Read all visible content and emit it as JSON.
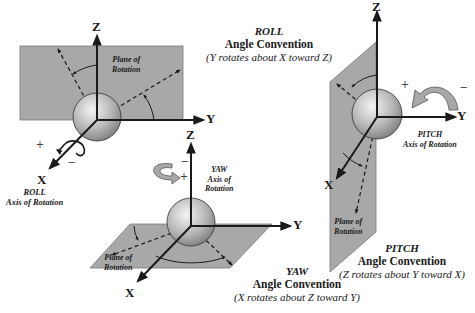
{
  "colors": {
    "plane": "#a8a8a8",
    "plane_edge": "#7a7a7a",
    "axis": "#1a1a1a",
    "ball_light": "#f2f2f2",
    "ball_dark": "#8a8a8a"
  },
  "roll": {
    "title": "ROLL",
    "subtitle": "Angle Convention",
    "description": "(Y rotates about X toward Z)",
    "plane_label_1": "Plane of",
    "plane_label_2": "Rotation",
    "axis_label_1": "ROLL",
    "axis_label_2": "Axis of Rotation",
    "axes": {
      "z": "Z",
      "y": "Y",
      "x": "X"
    },
    "plus": "+",
    "minus": "−"
  },
  "yaw": {
    "title": "YAW",
    "subtitle": "Angle Convention",
    "description": "(X rotates about Z toward Y)",
    "plane_label_1": "Plane of",
    "plane_label_2": "Rotation",
    "axis_label_1": "YAW",
    "axis_label_2": "Axis of",
    "axis_label_3": "Rotation",
    "axes": {
      "z": "Z",
      "y": "Y",
      "x": "X"
    },
    "plus": "+",
    "minus": "−"
  },
  "pitch": {
    "title": "PITCH",
    "subtitle": "Angle Convention",
    "description": "(Z rotates about Y toward  X)",
    "plane_label_1": "Plane of",
    "plane_label_2": "Rotation",
    "axis_label_1": "PITCH",
    "axis_label_2": "Axis of Rotation",
    "axes": {
      "z": "Z",
      "y": "Y",
      "x": "X"
    },
    "plus": "+",
    "minus": "−"
  }
}
